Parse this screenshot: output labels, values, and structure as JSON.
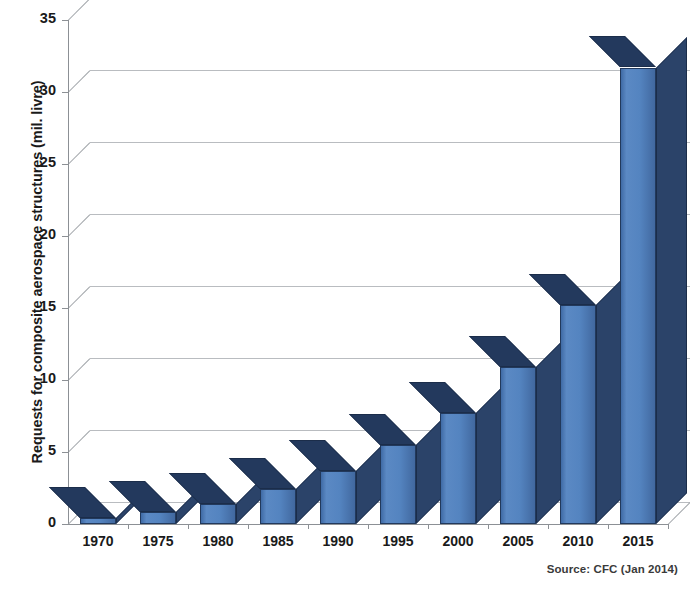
{
  "chart_data": {
    "type": "bar",
    "title": "",
    "xlabel": "",
    "ylabel": "Requests for composite aerospace structures (mil. livre)",
    "categories": [
      "1970",
      "1975",
      "1980",
      "1985",
      "1990",
      "1995",
      "2000",
      "2005",
      "2010",
      "2015"
    ],
    "values": [
      0.4,
      0.8,
      1.4,
      2.4,
      3.7,
      5.5,
      7.7,
      10.9,
      15.2,
      31.7
    ],
    "series": [
      {
        "name": "Requests for composite aerospace structures",
        "values": [
          0.4,
          0.8,
          1.4,
          2.4,
          3.7,
          5.5,
          7.7,
          10.9,
          15.2,
          31.7
        ]
      }
    ],
    "ylim": [
      0,
      35
    ],
    "y_ticks": [
      0,
      5,
      10,
      15,
      20,
      25,
      30,
      35
    ],
    "y_tick_labels": [
      "0",
      "5",
      "10",
      "15",
      "20",
      "25",
      "30",
      "35"
    ],
    "grid": true,
    "grid_axis": "y",
    "legend": false,
    "legend_position": "none",
    "style": "3d-column",
    "bar_color": "#4f7fba",
    "bar_side_color": "#2b4369",
    "bar_top_color": "#23395d",
    "bar_edge_color": "#22395c",
    "gridline_color": "#b9bcc0",
    "axis_color": "#8c9095",
    "background_color": "#ffffff",
    "annotations": [
      {
        "name": "source-note",
        "text": "Source: CFC (Jan 2014)"
      }
    ]
  },
  "source": {
    "text": "Source: CFC (Jan 2014)"
  }
}
